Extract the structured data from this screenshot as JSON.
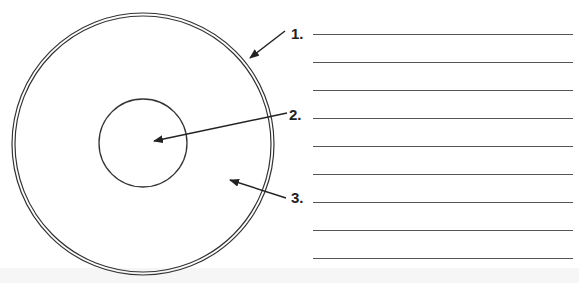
{
  "diagram": {
    "title_cut_off": "",
    "colors": {
      "stroke": "#333333",
      "line": "#555555",
      "background": "#ffffff"
    },
    "outer_circle": {
      "cx": 143,
      "cy": 144,
      "r": 131,
      "style": "double-line"
    },
    "inner_circle": {
      "cx": 143,
      "cy": 143,
      "r": 44
    },
    "callouts": [
      {
        "number": "1.",
        "x": 291,
        "y": 26,
        "arrow": {
          "x1": 285,
          "y1": 31,
          "x2": 250,
          "y2": 58
        }
      },
      {
        "number": "2.",
        "x": 289,
        "y": 107,
        "arrow": {
          "x1": 287,
          "y1": 113,
          "x2": 154,
          "y2": 141
        }
      },
      {
        "number": "3.",
        "x": 291,
        "y": 190,
        "arrow": {
          "x1": 286,
          "y1": 198,
          "x2": 230,
          "y2": 180
        }
      }
    ],
    "answer_lines_y": [
      34,
      62,
      90,
      118,
      146,
      174,
      202,
      230,
      258
    ]
  }
}
